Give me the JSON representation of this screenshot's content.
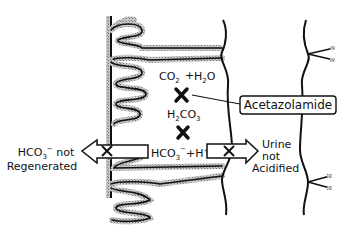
{
  "diagram": {
    "reaction": {
      "reactant1": "CO",
      "reactant1_sub": "2",
      "plus": "+",
      "reactant2": "H",
      "reactant2_sub": "2",
      "reactant2_tail": "O",
      "intermediate": "H",
      "intermediate_sub1": "2",
      "intermediate_mid": "CO",
      "intermediate_sub2": "3",
      "product1": "HCO",
      "product1_sub": "3",
      "product1_sup": "−",
      "product2": "H",
      "product2_sup": "+"
    },
    "inhibitor_label": "Acetazolamide",
    "left_label": {
      "line1": "HCO",
      "line1_sub": "3",
      "line1_sup": "−",
      "line1_tail": " not",
      "line2": "Regenerated"
    },
    "right_label": {
      "line1": "Urine",
      "line2": "not",
      "line3": "Acidified"
    },
    "colors": {
      "ink": "#111111",
      "stipple": "#9a9a9a",
      "background": "#ffffff"
    }
  }
}
